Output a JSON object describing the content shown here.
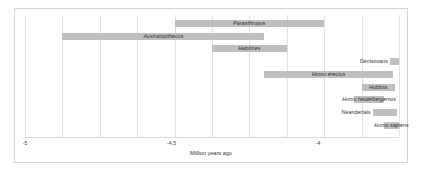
{
  "chart_data": {
    "type": "bar",
    "orientation": "horizontal-range",
    "title": "",
    "xlabel": "Million years ago",
    "ylabel": "",
    "xlim": [
      -5,
      0
    ],
    "xticks": [
      -5,
      -4.5,
      -4,
      -3.5,
      -3,
      -2.5,
      -2,
      -1.5,
      -1,
      -0.5,
      0
    ],
    "xtick_labels": [
      "-5",
      "-4.5",
      "-4",
      "-3.5",
      "-3",
      "-2.5",
      "-2",
      "-1.5",
      "-1",
      "-0.5",
      "0"
    ],
    "grid": true,
    "legend": "none",
    "bar_color": "#bfbfbf",
    "categories": [
      "Paranthropus",
      "Australopithecus",
      "Habilines",
      "Denisovans",
      "Homo erectus",
      "Hobbits",
      "Homo heidelbergensis",
      "Neandertals",
      "Homo sapiens"
    ],
    "ranges": [
      {
        "label": "Paranthropus",
        "start": -3.0,
        "end": -1.0,
        "label_pos": "center"
      },
      {
        "label": "Australopithecus",
        "start": -4.5,
        "end": -1.8,
        "label_pos": "center"
      },
      {
        "label": "Habilines",
        "start": -2.5,
        "end": -1.5,
        "label_pos": "center"
      },
      {
        "label": "Denisovans",
        "start": -0.12,
        "end": 0.0,
        "label_pos": "left-outside"
      },
      {
        "label": "Homo erectus",
        "start": -1.8,
        "end": -0.08,
        "label_pos": "center"
      },
      {
        "label": "Hobbits",
        "start": -0.5,
        "end": -0.05,
        "label_pos": "center"
      },
      {
        "label": "Homo heidelbergensis",
        "start": -0.6,
        "end": -0.2,
        "label_pos": "overlap"
      },
      {
        "label": "Neandertals",
        "start": -0.35,
        "end": -0.03,
        "label_pos": "left-outside"
      },
      {
        "label": "Homo sapiens",
        "start": -0.2,
        "end": 0.0,
        "label_pos": "overlap"
      }
    ]
  }
}
